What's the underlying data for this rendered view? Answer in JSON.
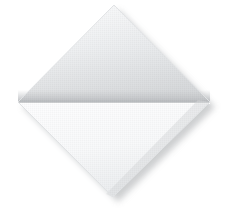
{
  "image": {
    "subject": "folded white napkin",
    "alt_text": "White folded napkin in diamond orientation",
    "orientation": "diamond",
    "background_color": "#ffffff",
    "canvas": {
      "width": 235,
      "height": 213
    }
  },
  "geometry": {
    "top_apex": {
      "x": 114,
      "y": 5
    },
    "left_corner": {
      "x": 18,
      "y": 102
    },
    "right_corner": {
      "x": 210,
      "y": 102
    },
    "bottom_apex": {
      "x": 113,
      "y": 197
    },
    "fold_line_y": 102,
    "fold_line_x_start": 18,
    "fold_line_x_end": 210
  },
  "panels": {
    "upper_flap": {
      "label": "upper folded flap",
      "fill_top": "#f3f4f5",
      "fill_bottom": "#dadcde",
      "seam_color": "#c9cbcd"
    },
    "lower_panel": {
      "label": "lower panel",
      "fill_top": "#fcfcfd",
      "fill_bottom": "#f0f1f2"
    }
  },
  "shadow": {
    "label": "drop shadow",
    "color": "#c4c6c8",
    "offset_x": 5,
    "offset_y": 5,
    "blur": 6
  },
  "texture": {
    "label": "woven linen weave",
    "pattern": "fine checkered weave"
  }
}
